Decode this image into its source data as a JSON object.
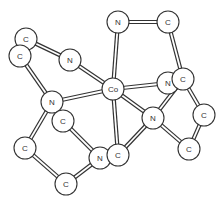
{
  "diagram": {
    "type": "molecular-structure",
    "central_atom": "Co",
    "atom_radius": 11,
    "colors": {
      "stroke": "#333333",
      "fill": "#ffffff",
      "background": "#ffffff"
    },
    "atoms": [
      {
        "id": "C1",
        "label": "C",
        "x": 26,
        "y": 39
      },
      {
        "id": "C2",
        "label": "C",
        "x": 20,
        "y": 56
      },
      {
        "id": "N1",
        "label": "N",
        "x": 70,
        "y": 60
      },
      {
        "id": "N2",
        "label": "N",
        "x": 118,
        "y": 22
      },
      {
        "id": "C3",
        "label": "C",
        "x": 168,
        "y": 22
      },
      {
        "id": "Co",
        "label": "Co",
        "x": 113,
        "y": 89
      },
      {
        "id": "N3",
        "label": "N",
        "x": 168,
        "y": 83
      },
      {
        "id": "C4",
        "label": "C",
        "x": 183,
        "y": 79
      },
      {
        "id": "N4",
        "label": "N",
        "x": 52,
        "y": 102
      },
      {
        "id": "C5",
        "label": "C",
        "x": 63,
        "y": 121
      },
      {
        "id": "N5",
        "label": "N",
        "x": 153,
        "y": 118
      },
      {
        "id": "C6",
        "label": "C",
        "x": 204,
        "y": 115
      },
      {
        "id": "C7",
        "label": "C",
        "x": 25,
        "y": 148
      },
      {
        "id": "N6",
        "label": "N",
        "x": 100,
        "y": 158
      },
      {
        "id": "C8",
        "label": "C",
        "x": 118,
        "y": 155
      },
      {
        "id": "C9",
        "label": "C",
        "x": 189,
        "y": 149
      },
      {
        "id": "C10",
        "label": "C",
        "x": 66,
        "y": 184
      }
    ],
    "bonds": [
      [
        "C1",
        "N1"
      ],
      [
        "N1",
        "Co"
      ],
      [
        "C2",
        "N4"
      ],
      [
        "N4",
        "Co"
      ],
      [
        "N2",
        "Co"
      ],
      [
        "N2",
        "C3"
      ],
      [
        "C3",
        "C4"
      ],
      [
        "Co",
        "N3"
      ],
      [
        "Co",
        "N5"
      ],
      [
        "Co",
        "C8"
      ],
      [
        "C4",
        "N5"
      ],
      [
        "C4",
        "C6"
      ],
      [
        "C6",
        "C9"
      ],
      [
        "N5",
        "C9"
      ],
      [
        "N5",
        "C8"
      ],
      [
        "N4",
        "C7"
      ],
      [
        "C7",
        "C10"
      ],
      [
        "C10",
        "N6"
      ],
      [
        "C5",
        "N6"
      ]
    ],
    "draw_order": [
      "N2",
      "C3",
      "N1",
      "C1",
      "C2",
      "Co",
      "N3",
      "C4",
      "N4",
      "C5",
      "N5",
      "C6",
      "C7",
      "C9",
      "N6",
      "C8",
      "C10"
    ]
  }
}
